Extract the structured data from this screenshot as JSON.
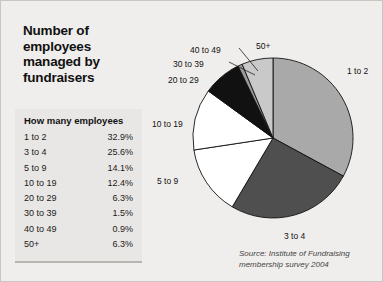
{
  "page": {
    "background_color": "#f0eeec",
    "border_color": "#c9c6c2"
  },
  "title": {
    "line1": "Number of",
    "line2": "employees",
    "line3": "managed by",
    "line4": "fundraisers"
  },
  "table": {
    "header": "How many employees",
    "rows": [
      {
        "label": "1 to 2",
        "value": "32.9%"
      },
      {
        "label": "3 to 4",
        "value": "25.6%"
      },
      {
        "label": "5 to 9",
        "value": "14.1%"
      },
      {
        "label": "10 to 19",
        "value": "12.4%"
      },
      {
        "label": "20 to 29",
        "value": "6.3%"
      },
      {
        "label": "30 to 39",
        "value": "1.5%"
      },
      {
        "label": "40 to 49",
        "value": "0.9%"
      },
      {
        "label": "50+",
        "value": "6.3%"
      }
    ]
  },
  "source": {
    "line1": "Source: Institute of Fundraising",
    "line2": "membership survey 2004"
  },
  "chart_data": {
    "type": "pie",
    "title": "Number of employees managed by fundraisers",
    "subtitle": "",
    "xlabel": "",
    "ylabel": "",
    "legend_position": "labels-around-pie",
    "grid": false,
    "start_angle_deg": 0,
    "direction": "clockwise",
    "units": "percent",
    "categories": [
      "1 to 2",
      "3 to 4",
      "5 to 9",
      "10 to 19",
      "20 to 29",
      "30 to 39",
      "40 to 49",
      "50+"
    ],
    "values": [
      32.9,
      25.6,
      14.1,
      12.4,
      6.3,
      1.5,
      0.9,
      6.3
    ],
    "slice_colors": [
      "#a9a9a9",
      "#4f4f4f",
      "#ffffff",
      "#ffffff",
      "#111111",
      "#111111",
      "#9a9a9a",
      "#c9c9c9"
    ],
    "slice_stroke": "#111111",
    "annotations": [
      "Source: Institute of Fundraising membership survey 2004"
    ],
    "labels": [
      {
        "text": "1 to 2",
        "x": 196,
        "y": 47,
        "leader": false
      },
      {
        "text": "3 to 4",
        "x": 133,
        "y": 212,
        "leader": false
      },
      {
        "text": "5 to 9",
        "x": 6,
        "y": 157,
        "leader": false
      },
      {
        "text": "10 to 19",
        "x": 1,
        "y": 100,
        "leader": false
      },
      {
        "text": "20 to 29",
        "x": 17,
        "y": 56,
        "leader": false
      },
      {
        "text": "30 to 39",
        "x": 22,
        "y": 40,
        "leader": true
      },
      {
        "text": "40 to 49",
        "x": 39,
        "y": 26,
        "leader": true
      },
      {
        "text": "50+",
        "x": 105,
        "y": 22,
        "leader": false
      }
    ]
  }
}
